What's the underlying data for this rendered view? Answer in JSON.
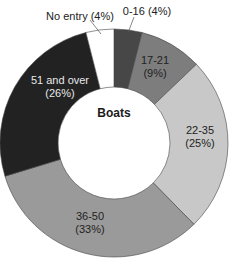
{
  "chart_data": {
    "type": "pie",
    "subtype": "donut",
    "title": "Boats",
    "start_angle": "12 o'clock, clockwise",
    "categories": [
      "0-16",
      "17-21",
      "22-35",
      "36-50",
      "51 and over",
      "No entry"
    ],
    "values": [
      4,
      9,
      25,
      33,
      26,
      4
    ],
    "unit": "%",
    "labels": [
      "0-16 (4%)",
      "17-21 (9%)",
      "22-35 (25%)",
      "36-50 (33%)",
      "51 and over (26%)",
      "No entry (4%)"
    ],
    "colors": [
      "#474747",
      "#7d7d7d",
      "#c8c8c8",
      "#9a9a9a",
      "#222222",
      "#ffffff"
    ],
    "label_colors": [
      "#222222",
      "#222222",
      "#222222",
      "#222222",
      "#e8e8e8",
      "#222222"
    ],
    "legend": "none (labels on slices)"
  },
  "labels": {
    "s0": "0-16 (4%)",
    "s1a": "17-21",
    "s1b": "(9%)",
    "s2a": "22-35",
    "s2b": "(25%)",
    "s3a": "36-50",
    "s3b": "(33%)",
    "s4a": "51 and over",
    "s4b": "(26%)",
    "s5": "No entry (4%)",
    "center": "Boats"
  }
}
